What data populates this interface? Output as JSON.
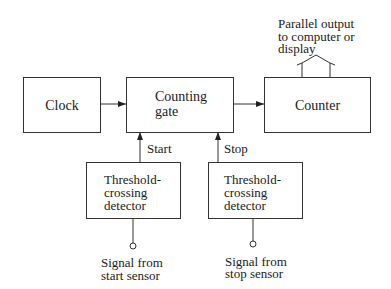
{
  "diagram": {
    "blocks": {
      "clock": "Clock",
      "counting_gate": [
        "Counting",
        "gate"
      ],
      "counter": "Counter",
      "start_detector": [
        "Threshold-",
        "crossing",
        "detector"
      ],
      "stop_detector": [
        "Threshold-",
        "crossing",
        "detector"
      ]
    },
    "labels": {
      "start": "Start",
      "stop": "Stop",
      "output": [
        "Parallel output",
        "to computer or",
        "display"
      ],
      "start_signal": [
        "Signal from",
        "start sensor"
      ],
      "stop_signal": [
        "Signal from",
        "stop sensor"
      ]
    },
    "connections": [
      {
        "from": "Clock",
        "to": "Counting gate"
      },
      {
        "from": "Counting gate",
        "to": "Counter"
      },
      {
        "from": "Threshold-crossing detector (start)",
        "to": "Counting gate",
        "label": "Start"
      },
      {
        "from": "Threshold-crossing detector (stop)",
        "to": "Counting gate",
        "label": "Stop"
      },
      {
        "from": "Signal from start sensor",
        "to": "Threshold-crossing detector (start)"
      },
      {
        "from": "Signal from stop sensor",
        "to": "Threshold-crossing detector (stop)"
      },
      {
        "from": "Counter",
        "to": "Parallel output to computer or display"
      }
    ]
  }
}
